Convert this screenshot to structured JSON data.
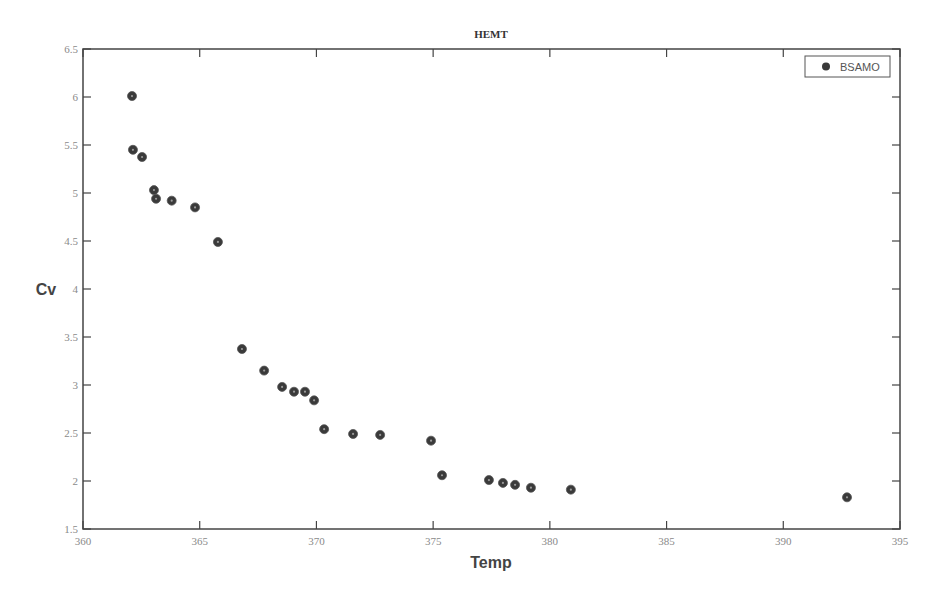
{
  "chart_data": {
    "type": "scatter",
    "title": "HEMT",
    "xlabel": "Temp",
    "ylabel": "Cv",
    "xlim": [
      360,
      395
    ],
    "ylim": [
      1.5,
      6.5
    ],
    "xticks": [
      360,
      365,
      370,
      375,
      380,
      385,
      390,
      395
    ],
    "yticks": [
      1.5,
      2,
      2.5,
      3,
      3.5,
      4,
      4.5,
      5,
      5.5,
      6,
      6.5
    ],
    "grid": false,
    "legend_position": "top-right",
    "series": [
      {
        "name": "BSAMO",
        "color": "#3a3a3a",
        "marker": "circle",
        "x": [
          362.1,
          362.14,
          362.53,
          363.04,
          363.13,
          363.8,
          364.8,
          365.78,
          366.81,
          367.76,
          368.53,
          369.04,
          369.51,
          369.9,
          370.33,
          371.57,
          372.73,
          374.91,
          375.38,
          377.39,
          377.99,
          378.51,
          379.19,
          380.9,
          392.73
        ],
        "y": [
          6.01,
          5.45,
          5.375,
          5.03,
          4.94,
          4.92,
          4.85,
          4.49,
          3.375,
          3.15,
          2.98,
          2.93,
          2.93,
          2.84,
          2.54,
          2.49,
          2.48,
          2.42,
          2.06,
          2.01,
          1.98,
          1.96,
          1.93,
          1.91,
          1.83
        ]
      }
    ]
  }
}
